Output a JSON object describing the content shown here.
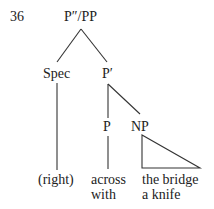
{
  "example_number": "36",
  "tree": {
    "root": "P″/PP",
    "spec": "Spec",
    "pbar": "P′",
    "p": "P",
    "np": "NP",
    "spec_leaf": "(right)",
    "p_leaf_line1": "across",
    "p_leaf_line2": "with",
    "np_leaf_line1": "the bridge",
    "np_leaf_line2": "a knife"
  }
}
